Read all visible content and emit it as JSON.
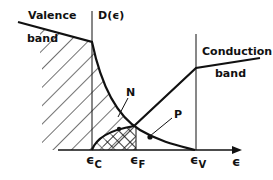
{
  "diagram": {
    "labels": {
      "valence": "Valence",
      "valence_band": "band",
      "axis_y": "D(ϵ)",
      "conduction": "Conduction",
      "conduction_band": "band",
      "n_label": "N",
      "p_label": "P",
      "axis_x": "ϵ",
      "eps_c_main": "ϵ",
      "eps_c_sub": "C",
      "eps_f_main": "ϵ",
      "eps_f_sub": "F",
      "eps_v_main": "ϵ",
      "eps_v_sub": "V"
    },
    "colors": {
      "ink": "#111111",
      "background": "#ffffff"
    }
  }
}
